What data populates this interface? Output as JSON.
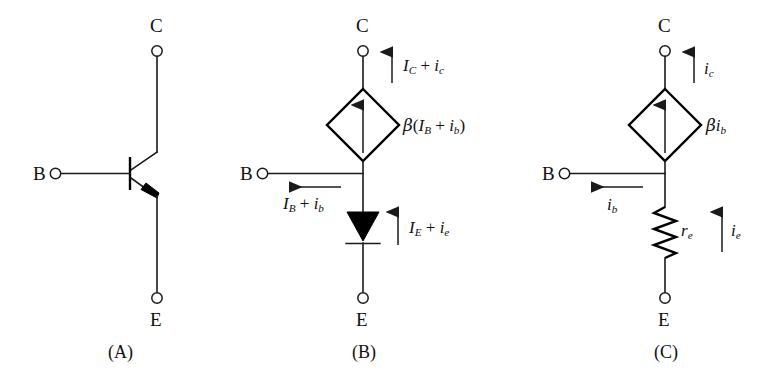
{
  "figure": {
    "background_color": "#ffffff",
    "line_color": "#1a1a1a"
  },
  "panels": [
    {
      "id": "panel-a",
      "caption": "(A)",
      "description": "npn bipolar junction transistor schematic symbol",
      "terminals": [
        {
          "name": "collector",
          "label": "C"
        },
        {
          "name": "base",
          "label": "B"
        },
        {
          "name": "emitter",
          "label": "E"
        }
      ],
      "components": [
        {
          "type": "transistor-npn",
          "name": "npn-transistor-symbol"
        }
      ],
      "current_labels": []
    },
    {
      "id": "panel-b",
      "caption": "(B)",
      "description": "Large-signal T model with dependent current source and diode",
      "terminals": [
        {
          "name": "collector",
          "label": "C"
        },
        {
          "name": "base",
          "label": "B"
        },
        {
          "name": "emitter",
          "label": "E"
        }
      ],
      "components": [
        {
          "type": "dependent-current-source",
          "name": "collector-current-source",
          "label_html": "&beta;(<i>I<sub>B</sub></i> + <i>i<sub>b</sub></i>)",
          "label_text": "β(I_B + i_b)"
        },
        {
          "type": "diode",
          "name": "emitter-diode",
          "label_text": ""
        }
      ],
      "current_labels": [
        {
          "name": "collector-current-label",
          "label_html": "<i>I<sub>C</sub></i> + <i>i<sub>c</sub></i>",
          "label_text": "I_C + i_c",
          "direction": "up"
        },
        {
          "name": "base-current-label",
          "label_html": "<i>I<sub>B</sub></i> + <i>i<sub>b</sub></i>",
          "label_text": "I_B + i_b",
          "direction": "left"
        },
        {
          "name": "emitter-current-label",
          "label_html": "<i>I<sub>E</sub></i> + <i>i<sub>e</sub></i>",
          "label_text": "I_E + i_e",
          "direction": "up"
        }
      ]
    },
    {
      "id": "panel-c",
      "caption": "(C)",
      "description": "Small-signal T model with dependent current source and emitter resistance",
      "terminals": [
        {
          "name": "collector",
          "label": "C"
        },
        {
          "name": "base",
          "label": "B"
        },
        {
          "name": "emitter",
          "label": "E"
        }
      ],
      "components": [
        {
          "type": "dependent-current-source",
          "name": "collector-current-source",
          "label_html": "&beta;<i>i<sub>b</sub></i>",
          "label_text": "βi_b"
        },
        {
          "type": "resistor",
          "name": "emitter-resistor",
          "label_html": "<i>r<sub>e</sub></i>",
          "label_text": "r_e"
        }
      ],
      "current_labels": [
        {
          "name": "collector-current-label",
          "label_html": "<i>i<sub>c</sub></i>",
          "label_text": "i_c",
          "direction": "up"
        },
        {
          "name": "base-current-label",
          "label_html": "<i>i<sub>b</sub></i>",
          "label_text": "i_b",
          "direction": "left"
        },
        {
          "name": "emitter-current-label",
          "label_html": "<i>i<sub>e</sub></i>",
          "label_text": "i_e",
          "direction": "up"
        }
      ]
    }
  ],
  "labels": {
    "a_caption": "(A)",
    "b_caption": "(B)",
    "c_caption": "(C)",
    "a_c": "C",
    "a_b": "B",
    "a_e": "E",
    "b_c": "C",
    "b_b": "B",
    "b_e": "E",
    "c_c": "C",
    "c_b": "B",
    "c_e": "E"
  }
}
